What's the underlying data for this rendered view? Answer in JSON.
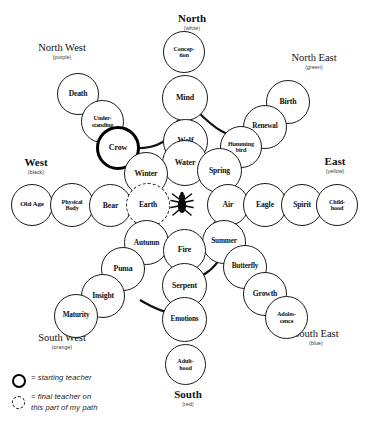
{
  "diagram": {
    "center_icon": "spider-icon",
    "directions": [
      {
        "key": "north",
        "name": "North",
        "color_label": "(white)",
        "kind": "cardinal"
      },
      {
        "key": "south",
        "name": "South",
        "color_label": "(red)",
        "kind": "cardinal"
      },
      {
        "key": "east",
        "name": "East",
        "color_label": "(yellow)",
        "kind": "cardinal"
      },
      {
        "key": "west",
        "name": "West",
        "color_label": "(black)",
        "kind": "cardinal"
      },
      {
        "key": "north_west",
        "name": "North West",
        "color_label": "(purple)",
        "kind": "ordinal"
      },
      {
        "key": "north_east",
        "name": "North East",
        "color_label": "(green)",
        "kind": "ordinal"
      },
      {
        "key": "south_west",
        "name": "South West",
        "color_label": "(orange)",
        "kind": "ordinal"
      },
      {
        "key": "south_east",
        "name": "South East",
        "color_label": "(blue)",
        "kind": "ordinal"
      }
    ],
    "nodes": [
      {
        "id": "conception",
        "label": "Concep-\ntion",
        "arm": "north",
        "marker": "none"
      },
      {
        "id": "mind",
        "label": "Mind",
        "arm": "north",
        "marker": "none"
      },
      {
        "id": "wolf",
        "label": "Wolf",
        "arm": "north",
        "marker": "none"
      },
      {
        "id": "water",
        "label": "Water",
        "arm": "north",
        "marker": "none"
      },
      {
        "id": "death",
        "label": "Death",
        "arm": "north_west",
        "marker": "none"
      },
      {
        "id": "understanding",
        "label": "Under-\nstanding",
        "arm": "north_west",
        "marker": "none"
      },
      {
        "id": "crow",
        "label": "Crow",
        "arm": "north_west",
        "marker": "starting"
      },
      {
        "id": "winter",
        "label": "Winter",
        "arm": "north_west",
        "marker": "none"
      },
      {
        "id": "birth",
        "label": "Birth",
        "arm": "north_east",
        "marker": "none"
      },
      {
        "id": "renewal",
        "label": "Renewal",
        "arm": "north_east",
        "marker": "none"
      },
      {
        "id": "hummingbird",
        "label": "Humming\nbird",
        "arm": "north_east",
        "marker": "none"
      },
      {
        "id": "spring",
        "label": "Spring",
        "arm": "north_east",
        "marker": "none"
      },
      {
        "id": "old_age",
        "label": "Old Age",
        "arm": "west",
        "marker": "none"
      },
      {
        "id": "physical_body",
        "label": "Physical\nBody",
        "arm": "west",
        "marker": "none"
      },
      {
        "id": "bear",
        "label": "Bear",
        "arm": "west",
        "marker": "none"
      },
      {
        "id": "earth",
        "label": "Earth",
        "arm": "west",
        "marker": "final"
      },
      {
        "id": "air",
        "label": "Air",
        "arm": "east",
        "marker": "none"
      },
      {
        "id": "eagle",
        "label": "Eagle",
        "arm": "east",
        "marker": "none"
      },
      {
        "id": "spirit",
        "label": "Spirit",
        "arm": "east",
        "marker": "none"
      },
      {
        "id": "childhood",
        "label": "Child-\nhood",
        "arm": "east",
        "marker": "none"
      },
      {
        "id": "autumn",
        "label": "Autumn",
        "arm": "south_west",
        "marker": "none"
      },
      {
        "id": "puma",
        "label": "Puma",
        "arm": "south_west",
        "marker": "none"
      },
      {
        "id": "insight",
        "label": "Insight",
        "arm": "south_west",
        "marker": "none"
      },
      {
        "id": "maturity",
        "label": "Maturity",
        "arm": "south_west",
        "marker": "none"
      },
      {
        "id": "summer",
        "label": "Summer",
        "arm": "south_east",
        "marker": "none"
      },
      {
        "id": "butterfly",
        "label": "Butterfly",
        "arm": "south_east",
        "marker": "none"
      },
      {
        "id": "growth",
        "label": "Growth",
        "arm": "south_east",
        "marker": "none"
      },
      {
        "id": "adolescence",
        "label": "Adoles-\ncence",
        "arm": "south_east",
        "marker": "none"
      },
      {
        "id": "fire",
        "label": "Fire",
        "arm": "south",
        "marker": "none"
      },
      {
        "id": "serpent",
        "label": "Serpent",
        "arm": "south",
        "marker": "none"
      },
      {
        "id": "emotions",
        "label": "Emotions",
        "arm": "south",
        "marker": "none"
      },
      {
        "id": "adulthood",
        "label": "Adult-\nhood",
        "arm": "south",
        "marker": "none"
      }
    ],
    "legend": [
      {
        "marker": "starting",
        "text": "= starting teacher"
      },
      {
        "marker": "final",
        "text": "= final teacher on\n   this part of my path"
      }
    ]
  }
}
